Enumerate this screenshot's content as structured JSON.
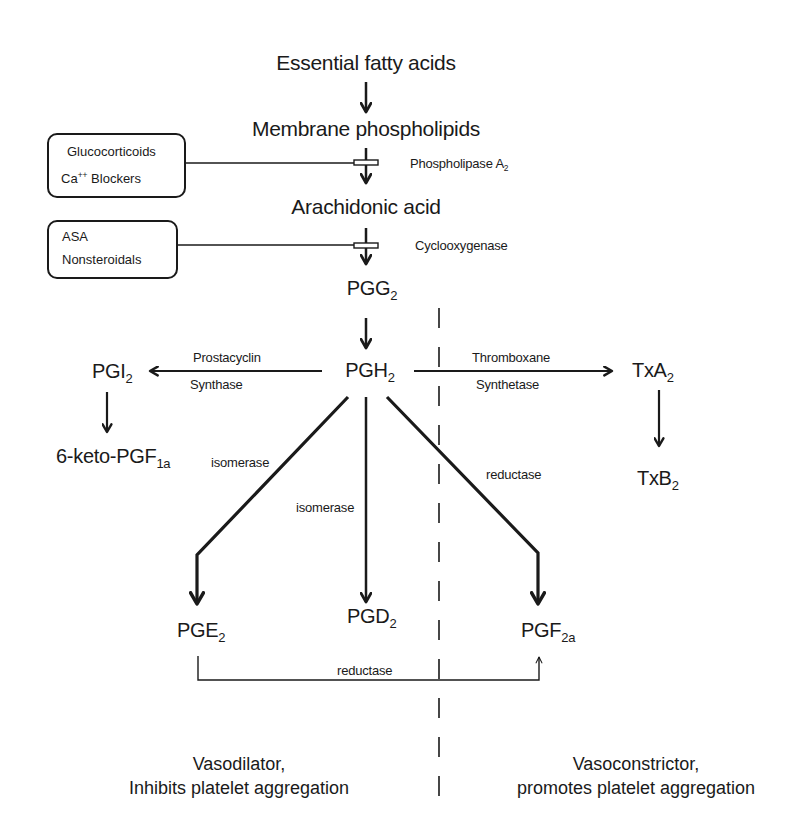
{
  "diagram": {
    "title_nodes": {
      "essential_fatty_acids": "Essential fatty acids",
      "membrane_phospholipids": "Membrane phospholipids",
      "arachidonic_acid": "Arachidonic acid",
      "pgg2": {
        "base": "PGG",
        "sub": "2"
      },
      "pgh2": {
        "base": "PGH",
        "sub": "2"
      },
      "pgi2": {
        "base": "PGI",
        "sub": "2"
      },
      "keto_pgf1a": {
        "base": "6-keto-PGF",
        "sub": "1a"
      },
      "txa2": {
        "base": "TxA",
        "sub": "2"
      },
      "txb2": {
        "base": "TxB",
        "sub": "2"
      },
      "pge2": {
        "base": "PGE",
        "sub": "2"
      },
      "pgd2": {
        "base": "PGD",
        "sub": "2"
      },
      "pgf2a": {
        "base": "PGF",
        "sub": "2a"
      }
    },
    "enzymes": {
      "phospholipase": {
        "base": "Phospholipase A",
        "sub": "2"
      },
      "cyclooxygenase": "Cyclooxygenase",
      "prostacyclin_line1": "Prostacyclin",
      "prostacyclin_line2": "Synthase",
      "thromboxane_line1": "Thromboxane",
      "thromboxane_line2": "Synthetase",
      "isomerase_left": "isomerase",
      "isomerase_center": "isomerase",
      "reductase_right": "reductase",
      "reductase_bottom": "reductase"
    },
    "inhibitors": {
      "box1": {
        "line1": "Glucocorticoids",
        "line2_base": "Ca",
        "line2_sup": "++",
        "line2_rest": " Blockers"
      },
      "box2": {
        "line1": "ASA",
        "line2": "Nonsteroidals"
      }
    },
    "outcomes": {
      "left": {
        "line1": "Vasodilator,",
        "line2": "Inhibits platelet aggregation"
      },
      "right": {
        "line1": "Vasoconstrictor,",
        "line2": "promotes platelet aggregation"
      }
    },
    "colors": {
      "ink": "#1a1a1a",
      "background": "#ffffff"
    }
  }
}
